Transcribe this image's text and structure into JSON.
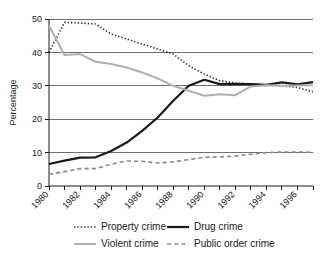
{
  "chart_data": {
    "type": "line",
    "title": "",
    "xlabel": "",
    "ylabel": "Percentage",
    "xlim": [
      1980,
      1997
    ],
    "ylim": [
      0,
      50
    ],
    "yticks": [
      0,
      10,
      20,
      30,
      40,
      50
    ],
    "ytick_labels": [
      "0",
      "10",
      "20",
      "30",
      "40",
      "50"
    ],
    "xticks": [
      1980,
      1982,
      1984,
      1986,
      1988,
      1990,
      1992,
      1994,
      1996
    ],
    "xtick_labels": [
      "1980",
      "1982",
      "1984",
      "1986",
      "1988",
      "1990",
      "1992",
      "1994",
      "1996"
    ],
    "x_minor_ticks": [
      1981,
      1983,
      1985,
      1987,
      1989,
      1991,
      1993,
      1995,
      1997
    ],
    "grid": "horizontal",
    "legend_position": "bottom",
    "x": [
      1980,
      1981,
      1982,
      1983,
      1984,
      1985,
      1986,
      1987,
      1988,
      1989,
      1990,
      1991,
      1992,
      1993,
      1994,
      1995,
      1996,
      1997
    ],
    "series": [
      {
        "name": "Property crime",
        "style": "dotted",
        "color": "#2b2b2b",
        "width": 1.6,
        "values": [
          40.0,
          49.0,
          48.8,
          48.5,
          45.5,
          44.0,
          42.5,
          41.0,
          39.5,
          36.0,
          33.5,
          31.5,
          30.8,
          30.5,
          30.2,
          30.0,
          29.5,
          28.2
        ]
      },
      {
        "name": "Drug crime",
        "style": "solid",
        "color": "#1a1a1a",
        "width": 2.2,
        "values": [
          6.6,
          7.6,
          8.5,
          8.6,
          10.5,
          13.0,
          16.5,
          20.5,
          25.5,
          30.0,
          31.8,
          30.5,
          30.6,
          30.5,
          30.3,
          31.0,
          30.4,
          31.1
        ]
      },
      {
        "name": "Violent crime",
        "style": "solid",
        "color": "#b0b0b0",
        "width": 2.0,
        "values": [
          48.0,
          39.2,
          39.5,
          37.2,
          36.5,
          35.5,
          34.0,
          32.2,
          30.0,
          28.5,
          27.0,
          27.5,
          27.2,
          29.8,
          30.2,
          30.0,
          30.1,
          30.2
        ]
      },
      {
        "name": "Public order crime",
        "style": "dashed",
        "color": "#8a8a8a",
        "width": 1.6,
        "values": [
          3.5,
          4.3,
          5.2,
          5.2,
          6.5,
          7.5,
          7.4,
          6.9,
          7.2,
          7.9,
          8.6,
          8.7,
          9.0,
          9.5,
          10.0,
          10.2,
          10.2,
          10.1
        ]
      }
    ]
  },
  "legend": {
    "entries": [
      {
        "label": "Property crime"
      },
      {
        "label": "Drug crime"
      },
      {
        "label": "Violent crime"
      },
      {
        "label": "Public order crime"
      }
    ]
  }
}
